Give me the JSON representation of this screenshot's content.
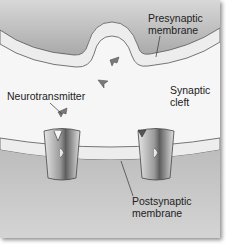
{
  "diagram": {
    "labels": {
      "presynaptic": [
        "Presynaptic",
        "membrane"
      ],
      "synaptic_cleft": [
        "Synaptic",
        "cleft"
      ],
      "neurotransmitter": "Neurotransmitter",
      "postsynaptic": [
        "Postsynaptic",
        "membrane"
      ]
    },
    "colors": {
      "presynaptic_fill": "#b9b9b9",
      "cleft_fill": "#f6f6f6",
      "membrane_fill": "#ececec",
      "postsynaptic_fill": "#c4c4c4",
      "receptor_light": "#dcdcdc",
      "receptor_dark": "#6d6d6d",
      "neurotransmitter": "#777777"
    }
  }
}
